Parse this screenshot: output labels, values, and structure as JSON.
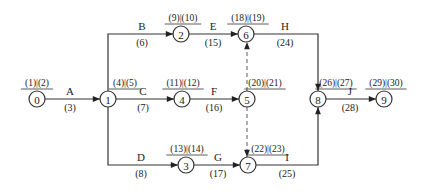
{
  "diagram": {
    "type": "activity-on-arrow network",
    "nodes": [
      {
        "id": "0",
        "x": 37,
        "y": 99,
        "tag": "(1)|(2)",
        "tag_x": 37,
        "tag_y": 86
      },
      {
        "id": "1",
        "x": 108,
        "y": 99,
        "tag": "(4)|(5)",
        "tag_x": 125,
        "tag_y": 86
      },
      {
        "id": "2",
        "x": 181,
        "y": 34,
        "tag": "(9)|(10)",
        "tag_x": 183,
        "tag_y": 21
      },
      {
        "id": "3",
        "x": 186,
        "y": 165,
        "tag": "(13)|(14)",
        "tag_x": 187,
        "tag_y": 152
      },
      {
        "id": "4",
        "x": 182,
        "y": 99,
        "tag": "(11)|(12)",
        "tag_x": 183,
        "tag_y": 86
      },
      {
        "id": "5",
        "x": 247,
        "y": 99,
        "tag": "(20)|(21)",
        "tag_x": 265,
        "tag_y": 86
      },
      {
        "id": "6",
        "x": 246,
        "y": 34,
        "tag": "(18)|(19)",
        "tag_x": 248,
        "tag_y": 21
      },
      {
        "id": "7",
        "x": 248,
        "y": 165,
        "tag": "(22)|(23)",
        "tag_x": 268,
        "tag_y": 152
      },
      {
        "id": "8",
        "x": 318,
        "y": 99,
        "tag": "(26)|(27)",
        "tag_x": 336,
        "tag_y": 86
      },
      {
        "id": "9",
        "x": 384,
        "y": 99,
        "tag": "(29)|(30)",
        "tag_x": 386,
        "tag_y": 86
      }
    ],
    "activities": [
      {
        "name": "A",
        "duration": "(3)",
        "from": "0",
        "to": "1",
        "lx": 70,
        "ly": 95,
        "dx": 70,
        "dy": 111
      },
      {
        "name": "B",
        "duration": "(6)",
        "from": "1",
        "to": "2",
        "lx": 142,
        "ly": 30,
        "dx": 142,
        "dy": 46
      },
      {
        "name": "C",
        "duration": "(7)",
        "from": "1",
        "to": "4",
        "lx": 143,
        "ly": 95,
        "dx": 143,
        "dy": 111
      },
      {
        "name": "D",
        "duration": "(8)",
        "from": "1",
        "to": "3",
        "lx": 141,
        "ly": 161,
        "dx": 141,
        "dy": 177
      },
      {
        "name": "E",
        "duration": "(15)",
        "from": "2",
        "to": "6",
        "lx": 213,
        "ly": 30,
        "dx": 213,
        "dy": 46
      },
      {
        "name": "F",
        "duration": "(16)",
        "from": "4",
        "to": "5",
        "lx": 214,
        "ly": 95,
        "dx": 214,
        "dy": 111
      },
      {
        "name": "G",
        "duration": "(17)",
        "from": "3",
        "to": "7",
        "lx": 218,
        "ly": 161,
        "dx": 218,
        "dy": 177
      },
      {
        "name": "H",
        "duration": "(24)",
        "from": "6",
        "to": "8",
        "lx": 285,
        "ly": 30,
        "dx": 285,
        "dy": 46
      },
      {
        "name": "I",
        "duration": "(25)",
        "from": "7",
        "to": "8",
        "lx": 287,
        "ly": 161,
        "dx": 287,
        "dy": 177
      },
      {
        "name": "J",
        "duration": "(28)",
        "from": "8",
        "to": "9",
        "lx": 350,
        "ly": 95,
        "dx": 350,
        "dy": 111
      }
    ],
    "dummy_activities": [
      {
        "from": "5",
        "to": "6"
      },
      {
        "from": "5",
        "to": "7"
      }
    ],
    "colors": {
      "line": "#333333",
      "dummy": "#777777",
      "text": "#222222"
    }
  }
}
